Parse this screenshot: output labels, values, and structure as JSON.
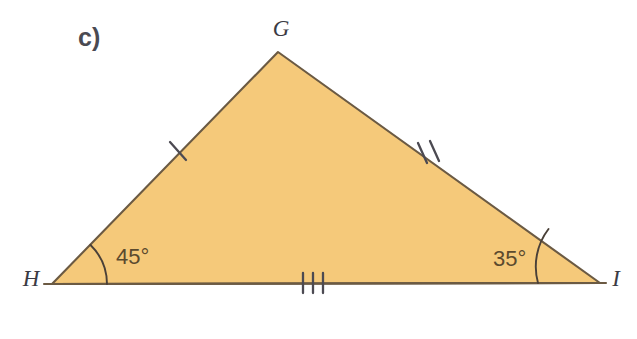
{
  "figure": {
    "part_label": "c)",
    "background_color": "#ffffff",
    "fill_color": "#f5c97a",
    "edge_color": "#6b5a43",
    "tick_color": "#4c4a52",
    "arc_color": "#4a4038",
    "angle_text_color": "#5b4a2e",
    "vertex_text_color": "#3b3b44",
    "shape": "triangle",
    "vertices": [
      {
        "name": "G",
        "label": "G",
        "x": 278,
        "y": 52,
        "label_x": 281,
        "label_y": 36
      },
      {
        "name": "H",
        "label": "H",
        "x": 52,
        "y": 284,
        "label_x": 31,
        "label_y": 286
      },
      {
        "name": "I",
        "label": "I",
        "x": 600,
        "y": 283,
        "label_x": 616,
        "label_y": 286
      }
    ],
    "sides": [
      {
        "name": "HG",
        "from": "H",
        "to": "G",
        "tick_count": 1,
        "tick_x": 178,
        "tick_y": 150
      },
      {
        "name": "GI",
        "from": "G",
        "to": "I",
        "tick_count": 2,
        "tick_x": 427,
        "tick_y": 152
      },
      {
        "name": "HI",
        "from": "H",
        "to": "I",
        "tick_count": 3,
        "tick_x": 313,
        "tick_y": 283
      }
    ],
    "angles": [
      {
        "at": "H",
        "value": "45°",
        "label_x": 116,
        "label_y": 264,
        "radius": 55
      },
      {
        "at": "I",
        "value": "35°",
        "label_x": 493,
        "label_y": 266,
        "radius": 62
      }
    ],
    "base_line": {
      "x1": 44,
      "y1": 284,
      "x2": 606,
      "y2": 283
    }
  }
}
